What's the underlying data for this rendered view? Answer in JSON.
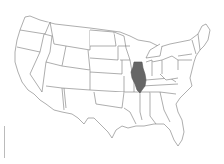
{
  "map": {
    "title": "United States",
    "highlighted_state": "Illinois",
    "highlight_color": "#666666",
    "border_color": "#777777",
    "fill_color": "#ffffff"
  }
}
